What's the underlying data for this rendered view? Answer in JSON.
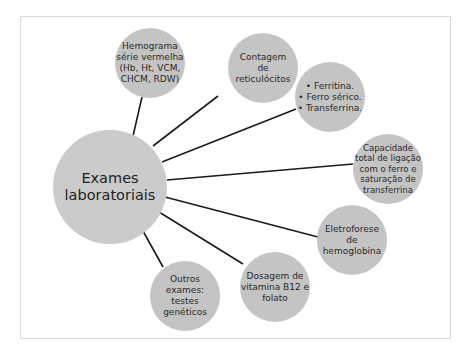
{
  "diagram": {
    "type": "radial-mind-map",
    "center": {
      "id": "center",
      "label": "Exames\nlaboratoriais",
      "x": 110,
      "y": 187,
      "r": 57
    },
    "nodes": [
      {
        "id": "hemograma",
        "label": "Hemograma\nsérie vermelha\n(Hb, Ht, VCM,\nCHCM, RDW)",
        "x": 150,
        "y": 63,
        "r": 35,
        "anchor": [
          138,
          95
        ]
      },
      {
        "id": "contagem",
        "label": "Contagem\nde\nreticulócitos",
        "x": 263,
        "y": 68,
        "r": 35,
        "anchor": [
          217,
          97
        ]
      },
      {
        "id": "ferro",
        "label": "• Ferritina.\n• Ferro sérico.\n• Transferrina.",
        "x": 330,
        "y": 97,
        "r": 35,
        "anchor": [
          292,
          108
        ]
      },
      {
        "id": "capacidade",
        "label": "Capacidade\ntotal de ligação\ncom o ferro e\nsaturação de\ntransferrina",
        "x": 388,
        "y": 169,
        "r": 35,
        "anchor": [
          344,
          165
        ]
      },
      {
        "id": "eletroforese",
        "label": "Eletroforese\nde\nhemoglobina",
        "x": 352,
        "y": 240,
        "r": 35,
        "anchor": [
          318,
          237
        ]
      },
      {
        "id": "dosagem",
        "label": "Dosagem de\nvitamina B12 e\nfolato",
        "x": 275,
        "y": 287,
        "r": 35,
        "anchor": [
          243,
          264
        ]
      },
      {
        "id": "outros",
        "label": "Outros\nexames:\ntestes\ngenéticos",
        "x": 185,
        "y": 296,
        "r": 35,
        "anchor": [
          163,
          266
        ]
      }
    ],
    "colors": {
      "node_fill": "#c4c4c4",
      "center_fill": "#cbcbcb",
      "line": "#1a1a1a",
      "frame_border": "#d8d8d8",
      "text": "#2a2a2a"
    }
  }
}
